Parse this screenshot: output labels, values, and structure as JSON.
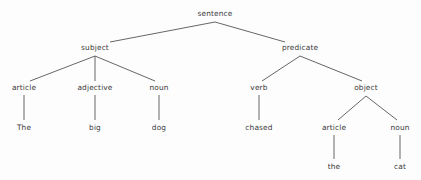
{
  "diagram": {
    "background_color": "#fdfdfd",
    "edge_color": "#555555",
    "text_color": "#3a3a3a",
    "sentence": "The big dog chased the cat",
    "nodes": [
      {
        "id": "sentence",
        "label": "sentence",
        "x": 215,
        "y": 14,
        "level": 0,
        "kind": "phrase"
      },
      {
        "id": "subject",
        "label": "subject",
        "x": 95,
        "y": 48,
        "level": 1,
        "kind": "phrase"
      },
      {
        "id": "predicate",
        "label": "predicate",
        "x": 300,
        "y": 48,
        "level": 1,
        "kind": "phrase"
      },
      {
        "id": "article1",
        "label": "article",
        "x": 24,
        "y": 88,
        "level": 2,
        "kind": "pos"
      },
      {
        "id": "adjective1",
        "label": "adjective",
        "x": 95,
        "y": 88,
        "level": 2,
        "kind": "pos"
      },
      {
        "id": "noun1",
        "label": "noun",
        "x": 159,
        "y": 88,
        "level": 2,
        "kind": "pos"
      },
      {
        "id": "verb1",
        "label": "verb",
        "x": 259,
        "y": 88,
        "level": 2,
        "kind": "pos"
      },
      {
        "id": "object",
        "label": "object",
        "x": 366,
        "y": 88,
        "level": 2,
        "kind": "phrase"
      },
      {
        "id": "word-the1",
        "label": "The",
        "x": 24,
        "y": 128,
        "level": 3,
        "kind": "word"
      },
      {
        "id": "word-big",
        "label": "big",
        "x": 95,
        "y": 128,
        "level": 3,
        "kind": "word"
      },
      {
        "id": "word-dog",
        "label": "dog",
        "x": 159,
        "y": 128,
        "level": 3,
        "kind": "word"
      },
      {
        "id": "word-chased",
        "label": "chased",
        "x": 259,
        "y": 128,
        "level": 3,
        "kind": "word"
      },
      {
        "id": "article2",
        "label": "article",
        "x": 334,
        "y": 128,
        "level": 3,
        "kind": "pos"
      },
      {
        "id": "noun2",
        "label": "noun",
        "x": 400,
        "y": 128,
        "level": 3,
        "kind": "pos"
      },
      {
        "id": "word-the2",
        "label": "the",
        "x": 334,
        "y": 167,
        "level": 4,
        "kind": "word"
      },
      {
        "id": "word-cat",
        "label": "cat",
        "x": 400,
        "y": 167,
        "level": 4,
        "kind": "word"
      }
    ],
    "edges": [
      {
        "from": "sentence",
        "to": "subject",
        "x1": 215,
        "y1": 22,
        "x2": 110,
        "y2": 42
      },
      {
        "from": "sentence",
        "to": "predicate",
        "x1": 215,
        "y1": 22,
        "x2": 285,
        "y2": 42
      },
      {
        "from": "subject",
        "to": "article1",
        "x1": 95,
        "y1": 56,
        "x2": 30,
        "y2": 81
      },
      {
        "from": "subject",
        "to": "adjective1",
        "x1": 95,
        "y1": 56,
        "x2": 95,
        "y2": 81
      },
      {
        "from": "subject",
        "to": "noun1",
        "x1": 95,
        "y1": 56,
        "x2": 155,
        "y2": 81
      },
      {
        "from": "predicate",
        "to": "verb1",
        "x1": 300,
        "y1": 56,
        "x2": 262,
        "y2": 81
      },
      {
        "from": "predicate",
        "to": "object",
        "x1": 300,
        "y1": 56,
        "x2": 362,
        "y2": 81
      },
      {
        "from": "article1",
        "to": "word-the1",
        "x1": 24,
        "y1": 95,
        "x2": 24,
        "y2": 120
      },
      {
        "from": "adjective1",
        "to": "word-big",
        "x1": 95,
        "y1": 95,
        "x2": 95,
        "y2": 120
      },
      {
        "from": "noun1",
        "to": "word-dog",
        "x1": 159,
        "y1": 95,
        "x2": 159,
        "y2": 120
      },
      {
        "from": "verb1",
        "to": "word-chased",
        "x1": 259,
        "y1": 95,
        "x2": 259,
        "y2": 120
      },
      {
        "from": "object",
        "to": "article2",
        "x1": 366,
        "y1": 96,
        "x2": 338,
        "y2": 120
      },
      {
        "from": "object",
        "to": "noun2",
        "x1": 366,
        "y1": 96,
        "x2": 397,
        "y2": 120
      },
      {
        "from": "article2",
        "to": "word-the2",
        "x1": 334,
        "y1": 135,
        "x2": 334,
        "y2": 159
      },
      {
        "from": "noun2",
        "to": "word-cat",
        "x1": 400,
        "y1": 135,
        "x2": 400,
        "y2": 159
      }
    ]
  }
}
